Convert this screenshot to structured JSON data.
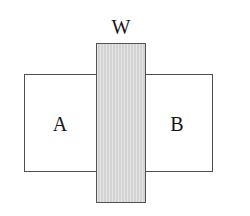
{
  "diagram": {
    "type": "set-overlap-diagram",
    "canvas": {
      "width": 250,
      "height": 216,
      "background_color": "#ffffff"
    },
    "labels": {
      "w": "W",
      "a": "A",
      "b": "B"
    },
    "shapes": {
      "base_rect": {
        "name": "horizontal-rectangle",
        "x": 24,
        "y": 74,
        "width": 189,
        "height": 98,
        "fill_color": "#ffffff",
        "border_color": "#4f4f4f"
      },
      "overlap_bar": {
        "name": "vertical-shaded-bar",
        "x": 96,
        "y": 43,
        "width": 50,
        "height": 160,
        "fill_color": "#d3d3d3",
        "border_color": "#535353"
      }
    }
  }
}
